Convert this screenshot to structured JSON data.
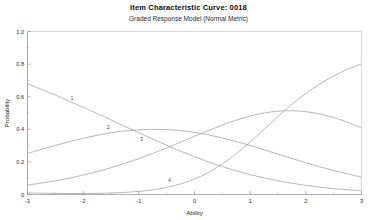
{
  "header": {
    "title": "Item Characteristic Curve: 0018",
    "subtitle": "Graded Response Model (Normal Metric)"
  },
  "axes": {
    "xlabel": "Ability",
    "ylabel": "Probability",
    "xticks": [
      "-3",
      "-2",
      "-1",
      "0",
      "1",
      "2",
      "3"
    ],
    "yticks": [
      "0",
      "0.2",
      "0.4",
      "0.6",
      "0.8",
      "1.0"
    ]
  },
  "curve_labels": {
    "c1": "1",
    "c2": "2",
    "c3": "3",
    "c4": "4"
  },
  "colors": {
    "curve": "#9a9a9a",
    "axis": "#8c8c8c",
    "frame": "#c9c9c9",
    "text": "#1a1a1a",
    "background": "#ffffff"
  },
  "chart_data": {
    "type": "line",
    "title": "Item Characteristic Curve: 0018",
    "subtitle": "Graded Response Model (Normal Metric)",
    "xlabel": "Ability",
    "ylabel": "Probability",
    "xlim": [
      -3,
      3
    ],
    "ylim": [
      0,
      1
    ],
    "xticks": [
      -3,
      -2,
      -1,
      0,
      1,
      2,
      3
    ],
    "yticks": [
      0,
      0.2,
      0.4,
      0.6,
      0.8,
      1.0
    ],
    "grid": false,
    "legend": "inline-curve-labels",
    "x": [
      -3,
      -2.75,
      -2.5,
      -2.25,
      -2,
      -1.75,
      -1.5,
      -1.25,
      -1,
      -0.75,
      -0.5,
      -0.25,
      0,
      0.25,
      0.5,
      0.75,
      1,
      1.25,
      1.5,
      1.75,
      2,
      2.25,
      2.5,
      2.75,
      3
    ],
    "series": [
      {
        "name": "1",
        "label": "1",
        "values": [
          0.68,
          0.645,
          0.61,
          0.573,
          0.535,
          0.497,
          0.458,
          0.418,
          0.379,
          0.34,
          0.302,
          0.266,
          0.232,
          0.2,
          0.171,
          0.145,
          0.122,
          0.102,
          0.084,
          0.069,
          0.056,
          0.045,
          0.036,
          0.029,
          0.023
        ]
      },
      {
        "name": "2",
        "label": "2",
        "values": [
          0.252,
          0.277,
          0.301,
          0.324,
          0.345,
          0.363,
          0.379,
          0.39,
          0.397,
          0.4,
          0.398,
          0.392,
          0.381,
          0.366,
          0.347,
          0.325,
          0.301,
          0.275,
          0.248,
          0.221,
          0.195,
          0.17,
          0.147,
          0.126,
          0.107
        ]
      },
      {
        "name": "3",
        "label": "3",
        "values": [
          0.058,
          0.07,
          0.084,
          0.1,
          0.119,
          0.14,
          0.164,
          0.191,
          0.22,
          0.252,
          0.286,
          0.321,
          0.357,
          0.392,
          0.426,
          0.456,
          0.481,
          0.5,
          0.511,
          0.514,
          0.508,
          0.494,
          0.472,
          0.443,
          0.409
        ]
      },
      {
        "name": "4",
        "label": "4",
        "values": [
          0.01,
          0.008,
          0.007,
          0.006,
          0.006,
          0.007,
          0.009,
          0.013,
          0.019,
          0.029,
          0.044,
          0.065,
          0.095,
          0.135,
          0.187,
          0.25,
          0.322,
          0.4,
          0.479,
          0.553,
          0.62,
          0.678,
          0.727,
          0.768,
          0.801
        ]
      }
    ],
    "annotations": [
      {
        "text": "1",
        "x": -2.2,
        "y": 0.58
      },
      {
        "text": "2",
        "x": -1.55,
        "y": 0.4
      },
      {
        "text": "3",
        "x": -0.95,
        "y": 0.33
      },
      {
        "text": "4",
        "x": -0.45,
        "y": 0.075
      }
    ]
  }
}
